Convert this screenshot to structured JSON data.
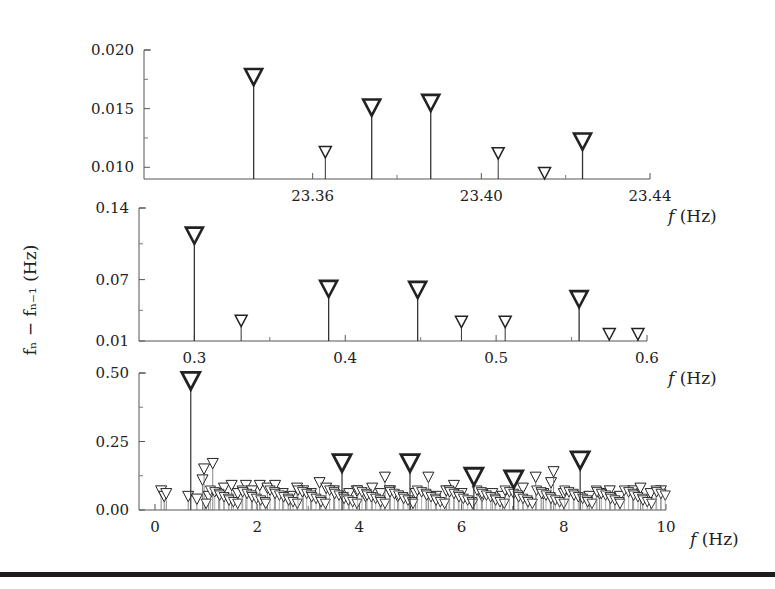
{
  "figure": {
    "y_label": "fₙ − fₙ₋₁ (Hz)",
    "x_label": "f (Hz)"
  },
  "chart_data": [
    {
      "type": "scatter",
      "style": "stem with downward triangle markers",
      "title": "",
      "xlabel": "f (Hz)",
      "ylabel": "f_n - f_{n-1} (Hz)",
      "xlim": [
        23.33,
        23.44
      ],
      "ylim": [
        0.009,
        0.02
      ],
      "x_ticks": [
        "23.36",
        "23.40",
        "23.44"
      ],
      "y_ticks": [
        "0.010",
        "0.015",
        "0.020"
      ],
      "grid": false,
      "points": [
        {
          "x": 23.346,
          "y": 0.017,
          "size": "large"
        },
        {
          "x": 23.363,
          "y": 0.0108,
          "size": "small"
        },
        {
          "x": 23.374,
          "y": 0.0144,
          "size": "large"
        },
        {
          "x": 23.388,
          "y": 0.0148,
          "size": "large"
        },
        {
          "x": 23.404,
          "y": 0.0107,
          "size": "small"
        },
        {
          "x": 23.415,
          "y": 0.009,
          "size": "small"
        },
        {
          "x": 23.424,
          "y": 0.0115,
          "size": "large"
        }
      ]
    },
    {
      "type": "scatter",
      "style": "stem with downward triangle markers",
      "title": "",
      "xlabel": "f (Hz)",
      "ylabel": "f_n - f_{n-1} (Hz)",
      "xlim": [
        0.268,
        0.6
      ],
      "ylim": [
        0.01,
        0.14
      ],
      "x_ticks": [
        "0.3",
        "0.4",
        "0.5",
        "0.6"
      ],
      "y_ticks": [
        "0.01",
        "0.07",
        "0.14"
      ],
      "grid": false,
      "points": [
        {
          "x": 0.3,
          "y": 0.105,
          "size": "large"
        },
        {
          "x": 0.331,
          "y": 0.024,
          "size": "small"
        },
        {
          "x": 0.389,
          "y": 0.053,
          "size": "large"
        },
        {
          "x": 0.448,
          "y": 0.052,
          "size": "large"
        },
        {
          "x": 0.477,
          "y": 0.023,
          "size": "small"
        },
        {
          "x": 0.506,
          "y": 0.023,
          "size": "small"
        },
        {
          "x": 0.555,
          "y": 0.043,
          "size": "large"
        },
        {
          "x": 0.575,
          "y": 0.011,
          "size": "small"
        },
        {
          "x": 0.594,
          "y": 0.011,
          "size": "small"
        }
      ]
    },
    {
      "type": "scatter",
      "style": "stem with downward triangle markers",
      "title": "",
      "xlabel": "f (Hz)",
      "ylabel": "f_n - f_{n-1} (Hz)",
      "xlim": [
        -0.3,
        10
      ],
      "ylim": [
        0.0,
        0.5
      ],
      "x_ticks": [
        "0",
        "2",
        "4",
        "6",
        "8",
        "10"
      ],
      "y_ticks": [
        "0.00",
        "0.25",
        "0.50"
      ],
      "grid": false,
      "major_points": [
        {
          "x": 0.7,
          "y": 0.44
        },
        {
          "x": 3.66,
          "y": 0.14
        },
        {
          "x": 4.99,
          "y": 0.14
        },
        {
          "x": 6.24,
          "y": 0.09
        },
        {
          "x": 7.02,
          "y": 0.08
        },
        {
          "x": 8.32,
          "y": 0.15
        }
      ],
      "minor_points": [
        {
          "x": 0.12,
          "y": 0.05
        },
        {
          "x": 0.18,
          "y": 0.03
        },
        {
          "x": 0.22,
          "y": 0.04
        },
        {
          "x": 0.65,
          "y": 0.03
        },
        {
          "x": 0.82,
          "y": 0.02
        },
        {
          "x": 0.93,
          "y": 0.09
        },
        {
          "x": 0.96,
          "y": 0.13
        },
        {
          "x": 1.13,
          "y": 0.15
        },
        {
          "x": 1.05,
          "y": 0.03
        },
        {
          "x": 1.25,
          "y": 0.04
        },
        {
          "x": 1.35,
          "y": 0.06
        },
        {
          "x": 1.5,
          "y": 0.07
        },
        {
          "x": 1.62,
          "y": 0.04
        },
        {
          "x": 1.78,
          "y": 0.07
        },
        {
          "x": 1.9,
          "y": 0.05
        },
        {
          "x": 2.05,
          "y": 0.07
        },
        {
          "x": 2.2,
          "y": 0.06
        },
        {
          "x": 2.35,
          "y": 0.07
        },
        {
          "x": 2.5,
          "y": 0.04
        },
        {
          "x": 2.65,
          "y": 0.03
        },
        {
          "x": 2.78,
          "y": 0.06
        },
        {
          "x": 2.9,
          "y": 0.05
        },
        {
          "x": 3.05,
          "y": 0.04
        },
        {
          "x": 3.22,
          "y": 0.08
        },
        {
          "x": 3.35,
          "y": 0.06
        },
        {
          "x": 3.5,
          "y": 0.05
        },
        {
          "x": 3.8,
          "y": 0.04
        },
        {
          "x": 3.95,
          "y": 0.05
        },
        {
          "x": 4.12,
          "y": 0.03
        },
        {
          "x": 4.25,
          "y": 0.06
        },
        {
          "x": 4.42,
          "y": 0.04
        },
        {
          "x": 4.5,
          "y": 0.1
        },
        {
          "x": 4.6,
          "y": 0.05
        },
        {
          "x": 4.75,
          "y": 0.03
        },
        {
          "x": 5.1,
          "y": 0.04
        },
        {
          "x": 5.35,
          "y": 0.1
        },
        {
          "x": 5.5,
          "y": 0.03
        },
        {
          "x": 5.7,
          "y": 0.05
        },
        {
          "x": 5.85,
          "y": 0.07
        },
        {
          "x": 6.0,
          "y": 0.04
        },
        {
          "x": 6.4,
          "y": 0.03
        },
        {
          "x": 6.6,
          "y": 0.04
        },
        {
          "x": 6.8,
          "y": 0.03
        },
        {
          "x": 7.2,
          "y": 0.06
        },
        {
          "x": 7.45,
          "y": 0.1
        },
        {
          "x": 7.6,
          "y": 0.04
        },
        {
          "x": 7.75,
          "y": 0.08
        },
        {
          "x": 7.8,
          "y": 0.12
        },
        {
          "x": 8.0,
          "y": 0.04
        },
        {
          "x": 8.5,
          "y": 0.03
        },
        {
          "x": 8.7,
          "y": 0.04
        },
        {
          "x": 8.9,
          "y": 0.05
        },
        {
          "x": 9.1,
          "y": 0.03
        },
        {
          "x": 9.35,
          "y": 0.05
        },
        {
          "x": 9.5,
          "y": 0.06
        },
        {
          "x": 9.7,
          "y": 0.04
        },
        {
          "x": 9.9,
          "y": 0.05
        }
      ],
      "note": "dense cluster of small triangles near baseline 0.00-0.08 across 0-10 Hz"
    }
  ],
  "layout": {
    "panels": [
      {
        "x0": 144,
        "x1": 650,
        "y_top": 50,
        "y_bot": 179,
        "xmin": 23.32,
        "xmax": 23.44,
        "ymin": 0.009,
        "ymax": 0.02,
        "tick_x": [
          23.36,
          23.4,
          23.44
        ],
        "tick_y": [
          0.01,
          0.015,
          0.02
        ],
        "xlabel_pos": [
          668,
          222
        ]
      },
      {
        "x0": 139,
        "x1": 647,
        "y_top": 208,
        "y_bot": 341,
        "xmin": 0.2633,
        "xmax": 0.6,
        "ymin": 0.01,
        "ymax": 0.14,
        "tick_x": [
          0.3,
          0.4,
          0.5,
          0.6
        ],
        "tick_y": [
          0.01,
          0.07,
          0.14
        ],
        "xlabel_pos": [
          668,
          384
        ]
      },
      {
        "x0": 139,
        "x1": 666,
        "y_top": 373,
        "y_bot": 510,
        "xmin": -0.313,
        "xmax": 10,
        "ymin": 0.0,
        "ymax": 0.5,
        "tick_x": [
          0,
          2,
          4,
          6,
          8,
          10
        ],
        "tick_y": [
          0.0,
          0.25,
          0.5
        ],
        "xlabel_pos": [
          690,
          545
        ]
      }
    ]
  }
}
